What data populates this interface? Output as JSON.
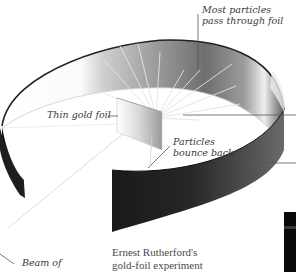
{
  "diagram": {
    "title": "Ernest Rutherford's gold-foil experiment",
    "caption_lines": [
      "Ernest Rutherford's",
      "gold-foil experiment"
    ],
    "labels": {
      "most_pass_line1": "Most particles",
      "most_pass_line2": "pass through foil",
      "thin_foil": "Thin gold foil",
      "bounce_line1": "Particles",
      "bounce_line2": "bounce back",
      "beam": "Beam of"
    },
    "components": [
      "circular detection screen",
      "thin gold foil",
      "particle beam",
      "particle paths"
    ],
    "colors": {
      "screen_dark": "#1c1c1c",
      "screen_mid": "#5a5a5a",
      "screen_light": "#f4f4f4",
      "leader_line": "#555555",
      "rays": "#e6e6e6",
      "text": "#3a3a3a"
    }
  }
}
